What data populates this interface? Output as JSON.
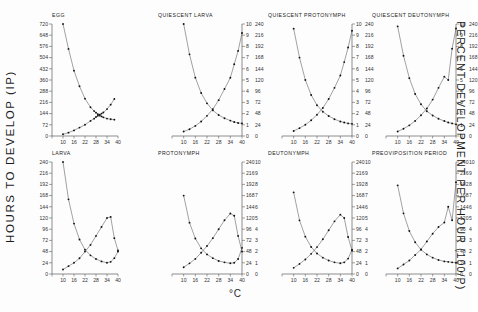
{
  "figure": {
    "ylabel_left": "HOURS TO DEVELOP (IP)",
    "ylabel_right": "PERCENT DEVELOPMENT PER HOUR (100/P)",
    "xlabel": "°C"
  },
  "chart_data": {
    "type": "line",
    "xlabel": "°C",
    "ylabel": "HOURS TO DEVELOP (IP)",
    "ylabel2": "PERCENT DEVELOPMENT PER HOUR (100/P)",
    "xlim": [
      4,
      40
    ],
    "xticks": [
      4,
      10,
      16,
      22,
      28,
      34,
      40
    ],
    "grid": false,
    "legend": "none",
    "panels": [
      {
        "name": "EGG",
        "title": "EGG",
        "row": 0,
        "col": 0,
        "y_left_label": "hours to develop",
        "ylim_left": [
          0,
          720
        ],
        "yticks_left": [
          0,
          72,
          144,
          216,
          288,
          360,
          432,
          504,
          576,
          648,
          720
        ],
        "ylim_right": [
          0,
          10
        ],
        "yticks_right": [
          0,
          1,
          2,
          3,
          4,
          5,
          6,
          7,
          8,
          9,
          10
        ],
        "yticks_right_hours": [
          0,
          24,
          48,
          72,
          96,
          120,
          144,
          168,
          192,
          216,
          240
        ],
        "series": [
          {
            "name": "hours to develop (P)",
            "axis": "left",
            "x": [
              10,
              13,
              16,
              19,
              22,
              25,
              27,
              28,
              29,
              30,
              31,
              32,
              34,
              36,
              38
            ],
            "values": [
              720,
              560,
              420,
              320,
              240,
              185,
              160,
              150,
              140,
              132,
              126,
              120,
              112,
              108,
              105
            ]
          },
          {
            "name": "percent development per hour (100/P)",
            "axis": "right",
            "x": [
              10,
              13,
              16,
              19,
              22,
              25,
              27,
              28,
              29,
              30,
              31,
              32,
              34,
              36,
              38
            ],
            "values": [
              0.15,
              0.3,
              0.5,
              0.75,
              1.0,
              1.35,
              1.55,
              1.7,
              1.8,
              1.9,
              2.0,
              2.1,
              2.4,
              2.8,
              3.3
            ]
          }
        ]
      },
      {
        "name": "QUIESCENT LARVA",
        "title": "QUIESCENT LARVA",
        "row": 0,
        "col": 1,
        "ylim_left": [
          0,
          10
        ],
        "yticks_left": [
          0,
          1,
          2,
          3,
          4,
          5,
          6,
          7,
          8,
          9,
          10
        ],
        "ylim_right": [
          0,
          240
        ],
        "yticks_right": [
          0,
          24,
          48,
          72,
          96,
          120,
          144,
          168,
          192,
          216,
          240
        ],
        "series": [
          {
            "name": "hours to develop (P)",
            "axis": "left",
            "x": [
              10,
              13,
              16,
              19,
              22,
              25,
              28,
              31,
              34,
              36,
              38,
              40
            ],
            "values": [
              240,
              175,
              125,
              92,
              70,
              55,
              45,
              38,
              33,
              30,
              28,
              27
            ]
          },
          {
            "name": "percent development per hour (100/P)",
            "axis": "right",
            "x": [
              10,
              13,
              16,
              19,
              22,
              25,
              28,
              31,
              34,
              36,
              38,
              40
            ],
            "values": [
              0.4,
              0.6,
              0.9,
              1.3,
              1.8,
              2.4,
              3.2,
              4.2,
              5.2,
              6.4,
              7.6,
              9.2
            ]
          }
        ]
      },
      {
        "name": "QUIESCENT PROTONYMPH",
        "title": "QUIESCENT PROTONYMPH",
        "row": 0,
        "col": 2,
        "ylim_left": [
          0,
          10
        ],
        "yticks_left": [
          0,
          1,
          2,
          3,
          4,
          5,
          6,
          7,
          8,
          9,
          10
        ],
        "ylim_right": [
          0,
          240
        ],
        "yticks_right": [
          0,
          24,
          48,
          72,
          96,
          120,
          144,
          168,
          192,
          216,
          240
        ],
        "series": [
          {
            "name": "hours to develop (P)",
            "axis": "left",
            "x": [
              10,
              13,
              16,
              19,
              22,
              25,
              28,
              31,
              34,
              36,
              38,
              40
            ],
            "values": [
              230,
              168,
              120,
              88,
              66,
              52,
              43,
              36,
              31,
              29,
              27,
              26
            ]
          },
          {
            "name": "percent development per hour (100/P)",
            "axis": "right",
            "x": [
              10,
              13,
              16,
              19,
              22,
              25,
              28,
              31,
              34,
              36,
              38,
              40
            ],
            "values": [
              0.45,
              0.7,
              1.0,
              1.4,
              1.9,
              2.5,
              3.3,
              4.3,
              5.4,
              6.6,
              7.9,
              9.4
            ]
          }
        ]
      },
      {
        "name": "QUIESCENT DEUTONYMPH",
        "title": "QUIESCENT DEUTONYMPH",
        "row": 0,
        "col": 3,
        "ylim_left": [
          0,
          10
        ],
        "yticks_left": [
          0,
          1,
          2,
          3,
          4,
          5,
          6,
          7,
          8,
          9,
          10
        ],
        "ylim_right": [
          0,
          240
        ],
        "yticks_right": [
          0,
          24,
          48,
          72,
          96,
          120,
          144,
          168,
          192,
          216,
          240
        ],
        "series": [
          {
            "name": "hours to develop (P)",
            "axis": "left",
            "x": [
              10,
              13,
              16,
              19,
              22,
              25,
              28,
              31,
              34,
              36,
              38,
              40
            ],
            "values": [
              235,
              172,
              124,
              90,
              68,
              53,
              44,
              37,
              32,
              29,
              27,
              25
            ]
          },
          {
            "name": "percent development per hour (100/P)",
            "axis": "right",
            "x": [
              10,
              13,
              16,
              19,
              22,
              25,
              28,
              31,
              34,
              36,
              38,
              40
            ],
            "values": [
              0.4,
              0.65,
              0.95,
              1.35,
              1.85,
              2.45,
              3.25,
              4.3,
              5.3,
              5.0,
              7.8,
              9.6
            ]
          }
        ]
      },
      {
        "name": "LARVA",
        "title": "LARVA",
        "row": 1,
        "col": 0,
        "ylim_left": [
          0,
          240
        ],
        "yticks_left": [
          0,
          24,
          48,
          72,
          96,
          120,
          144,
          168,
          192,
          216,
          240
        ],
        "ylim_right": [
          0,
          10
        ],
        "yticks_right": [
          0,
          1,
          2,
          3,
          4,
          5,
          6,
          7,
          8,
          9,
          10
        ],
        "series": [
          {
            "name": "hours to develop (P)",
            "axis": "left",
            "x": [
              10,
              13,
              16,
              19,
              22,
              25,
              28,
              31,
              34,
              36,
              38,
              40
            ],
            "values": [
              240,
              160,
              108,
              74,
              52,
              40,
              32,
              27,
              24,
              26,
              34,
              48
            ]
          },
          {
            "name": "percent development per hour (100/P)",
            "axis": "right",
            "x": [
              10,
              13,
              16,
              19,
              22,
              25,
              28,
              31,
              34,
              36,
              38,
              40
            ],
            "values": [
              0.4,
              0.7,
              1.0,
              1.4,
              2.0,
              2.6,
              3.4,
              4.2,
              5.0,
              5.1,
              3.2,
              2.1
            ]
          }
        ]
      },
      {
        "name": "PROTONYMPH",
        "title": "PROTONYMPH",
        "row": 1,
        "col": 1,
        "ylim_left": [
          0,
          240
        ],
        "yticks_left": [
          0,
          24,
          48,
          72,
          96,
          120,
          144,
          168,
          192,
          216,
          240
        ],
        "ylim_right": [
          0,
          10
        ],
        "yticks_right": [
          0,
          1,
          2,
          3,
          4,
          5,
          6,
          7,
          8,
          9,
          10
        ],
        "series": [
          {
            "name": "hours to develop (P)",
            "axis": "left",
            "x": [
              10,
              13,
              16,
              19,
              22,
              25,
              28,
              31,
              34,
              36,
              38,
              40
            ],
            "values": [
              168,
              110,
              76,
              55,
              42,
              34,
              28,
              25,
              23,
              24,
              32,
              56
            ]
          },
          {
            "name": "percent development per hour (100/P)",
            "axis": "right",
            "x": [
              10,
              13,
              16,
              19,
              22,
              25,
              28,
              31,
              34,
              36,
              38,
              40
            ],
            "values": [
              0.6,
              0.95,
              1.35,
              1.9,
              2.5,
              3.2,
              4.0,
              4.8,
              5.4,
              5.2,
              3.4,
              2.0
            ]
          }
        ]
      },
      {
        "name": "DEUTONYMPH",
        "title": "DEUTONYMPH",
        "row": 1,
        "col": 2,
        "ylim_left": [
          0,
          240
        ],
        "yticks_left": [
          0,
          24,
          48,
          72,
          96,
          120,
          144,
          168,
          192,
          216,
          240
        ],
        "ylim_right": [
          0,
          10
        ],
        "yticks_right": [
          0,
          1,
          2,
          3,
          4,
          5,
          6,
          7,
          8,
          9,
          10
        ],
        "series": [
          {
            "name": "hours to develop (P)",
            "axis": "left",
            "x": [
              10,
              13,
              16,
              19,
              22,
              25,
              28,
              31,
              34,
              36,
              38,
              40
            ],
            "values": [
              175,
              115,
              80,
              58,
              44,
              35,
              29,
              25,
              23,
              25,
              33,
              52
            ]
          },
          {
            "name": "percent development per hour (100/P)",
            "axis": "right",
            "x": [
              10,
              13,
              16,
              19,
              22,
              25,
              28,
              31,
              34,
              36,
              38,
              40
            ],
            "values": [
              0.55,
              0.9,
              1.3,
              1.8,
              2.4,
              3.1,
              3.9,
              4.7,
              5.3,
              5.0,
              3.3,
              2.1
            ]
          }
        ]
      },
      {
        "name": "PREOVIPOSITION PERIOD",
        "title": "PREOVIPOSITION PERIOD",
        "row": 1,
        "col": 3,
        "ylim_left": [
          0,
          240
        ],
        "yticks_left": [
          0,
          24,
          48,
          72,
          96,
          120,
          144,
          168,
          192,
          216,
          240
        ],
        "ylim_right": [
          0,
          10
        ],
        "yticks_right": [
          0,
          1,
          2,
          3,
          4,
          5,
          6,
          7,
          8,
          9,
          10
        ],
        "series": [
          {
            "name": "hours to develop (P)",
            "axis": "left",
            "x": [
              10,
              13,
              16,
              19,
              22,
              25,
              28,
              31,
              34,
              36,
              38,
              40
            ],
            "values": [
              190,
              130,
              92,
              68,
              52,
              42,
              35,
              30,
              27,
              26,
              25,
              24
            ]
          },
          {
            "name": "percent development per hour (100/P)",
            "axis": "right",
            "x": [
              10,
              13,
              16,
              19,
              22,
              25,
              28,
              31,
              34,
              36,
              38,
              40
            ],
            "values": [
              0.5,
              0.85,
              1.2,
              1.7,
              2.2,
              2.9,
              3.6,
              4.2,
              4.6,
              6.0,
              4.8,
              8.2
            ]
          }
        ]
      }
    ]
  }
}
